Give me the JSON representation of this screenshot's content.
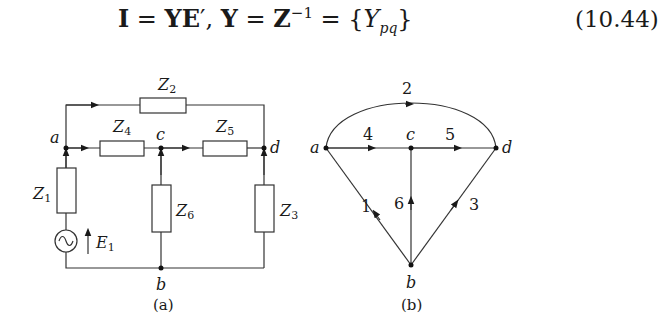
{
  "equation": {
    "lhs_I": "I",
    "eq1": " = ",
    "Y1": "Y",
    "E": "E",
    "prime": "′",
    "comma": ", ",
    "Y2": "Y",
    "eq2": " = ",
    "Z": "Z",
    "inv": "−1",
    "eq3": " = {",
    "Yel": "Y",
    "sub": "pq",
    "close": "}",
    "number": "(10.44)"
  },
  "circuit": {
    "caption": "(a)",
    "nodes": {
      "a": "a",
      "b": "b",
      "c": "c",
      "d": "d"
    },
    "impedances": [
      {
        "id": "Z1",
        "base": "Z",
        "sub": "1"
      },
      {
        "id": "Z2",
        "base": "Z",
        "sub": "2"
      },
      {
        "id": "Z3",
        "base": "Z",
        "sub": "3"
      },
      {
        "id": "Z4",
        "base": "Z",
        "sub": "4"
      },
      {
        "id": "Z5",
        "base": "Z",
        "sub": "5"
      },
      {
        "id": "Z6",
        "base": "Z",
        "sub": "6"
      }
    ],
    "source": {
      "base": "E",
      "sub": "1"
    }
  },
  "graph": {
    "caption": "(b)",
    "nodes": {
      "a": "a",
      "b": "b",
      "c": "c",
      "d": "d"
    },
    "edges": [
      "1",
      "2",
      "3",
      "4",
      "5",
      "6"
    ]
  }
}
